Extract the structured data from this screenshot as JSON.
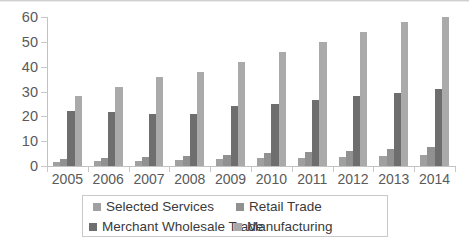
{
  "chart_data": {
    "type": "bar",
    "title": "",
    "xlabel": "",
    "ylabel": "",
    "ylim": [
      0,
      60
    ],
    "yticks": [
      0,
      10,
      20,
      30,
      40,
      50,
      60
    ],
    "grid": false,
    "legend_position": "bottom",
    "categories": [
      "2005",
      "2006",
      "2007",
      "2008",
      "2009",
      "2010",
      "2011",
      "2012",
      "2013",
      "2014"
    ],
    "series": [
      {
        "name": "Selected Services",
        "color": "#a0a0a0",
        "values": [
          1.6,
          2.0,
          2.1,
          2.5,
          2.8,
          3.2,
          3.4,
          3.8,
          4.2,
          4.6
        ]
      },
      {
        "name": "Retail Trade",
        "color": "#919191",
        "values": [
          2.8,
          3.3,
          3.6,
          4.0,
          4.4,
          5.1,
          5.6,
          6.1,
          6.9,
          7.6
        ]
      },
      {
        "name": "Merchant Wholesale Trade",
        "color": "#6e6e6e",
        "values": [
          22,
          21.8,
          21,
          21,
          24,
          25,
          26.4,
          28,
          29.6,
          31
        ]
      },
      {
        "name": "Manufacturing",
        "color": "#aaaaaa",
        "values": [
          28,
          32,
          36,
          38,
          42,
          46,
          50,
          54,
          58,
          60
        ]
      }
    ]
  },
  "legend": {
    "items": [
      {
        "label": "Selected Services",
        "color": "#a0a0a0"
      },
      {
        "label": "Retail Trade",
        "color": "#919191"
      },
      {
        "label": "Merchant Wholesale Trade",
        "color": "#6e6e6e"
      },
      {
        "label": "Manufacturing",
        "color": "#aaaaaa"
      }
    ]
  }
}
